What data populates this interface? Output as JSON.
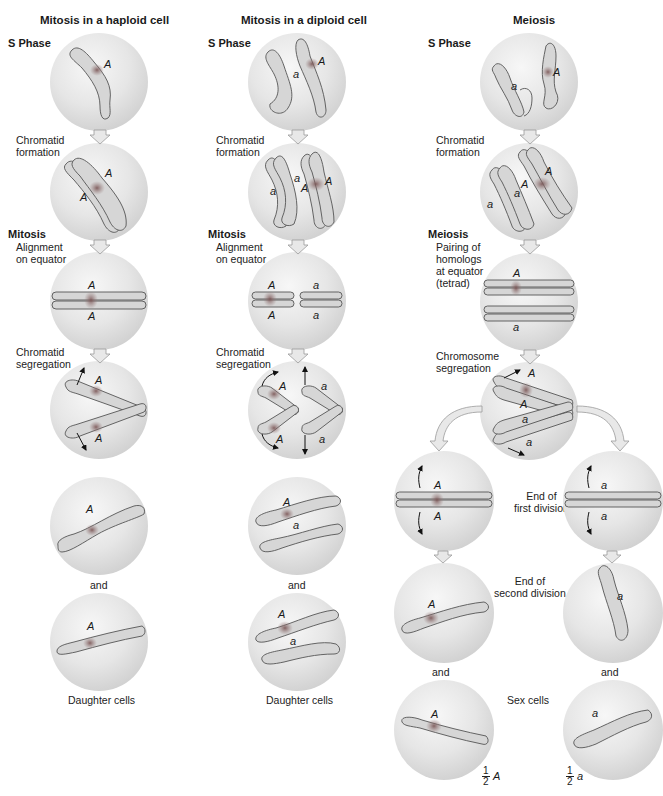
{
  "columns": [
    {
      "title": "Mitosis in a haploid cell",
      "phases": {
        "s_phase": "S Phase",
        "division": "Mitosis"
      },
      "steps": [
        "Chromatid\nformation",
        "Alignment\non equator",
        "Chromatid\nsegregation"
      ],
      "captions": {
        "and": "and",
        "result": "Daughter cells"
      },
      "gene_labels": {
        "s_phase": [
          "A"
        ],
        "chromatid": [
          "A",
          "A"
        ],
        "alignment": [
          "A",
          "A"
        ],
        "segregation": [
          "A",
          "A"
        ],
        "daughter_1": [
          "A"
        ],
        "daughter_2": [
          "A"
        ]
      }
    },
    {
      "title": "Mitosis in a diploid cell",
      "phases": {
        "s_phase": "S Phase",
        "division": "Mitosis"
      },
      "steps": [
        "Chromatid\nformation",
        "Alignment\non equator",
        "Chromatid\nsegregation"
      ],
      "captions": {
        "and": "and",
        "result": "Daughter cells"
      },
      "gene_labels": {
        "s_phase": [
          "a",
          "A"
        ],
        "chromatid": [
          "a",
          "a",
          "A",
          "A"
        ],
        "alignment": [
          "A",
          "a",
          "A",
          "a"
        ],
        "segregation": [
          "A",
          "a",
          "A",
          "a"
        ],
        "daughter_1": [
          "A",
          "a"
        ],
        "daughter_2": [
          "A",
          "a"
        ]
      }
    },
    {
      "title": "Meiosis",
      "phases": {
        "s_phase": "S Phase",
        "division": "Meiosis"
      },
      "steps": [
        "Chromatid\nformation",
        "Pairing of\nhomologs\nat equator\n(tetrad)",
        "Chromosome\nsegregation"
      ],
      "stage_labels": [
        "End of\nfirst division",
        "End of\nsecond division",
        "Sex cells"
      ],
      "captions": {
        "and_left": "and",
        "and_right": "and"
      },
      "gene_labels": {
        "s_phase": [
          "a",
          "A"
        ],
        "chromatid": [
          "a",
          "a",
          "A",
          "A"
        ],
        "tetrad": [
          "A",
          "a"
        ],
        "segregation": [
          "A",
          "A",
          "a",
          "a"
        ],
        "first_division_left": [
          "A",
          "A"
        ],
        "first_division_right": [
          "a",
          "a"
        ],
        "second_division_left": [
          "A"
        ],
        "second_division_right": [
          "a"
        ],
        "sex_cell_left": [
          "A"
        ],
        "sex_cell_right": [
          "a"
        ]
      },
      "fractions": [
        {
          "numerator": "1",
          "denominator": "2",
          "allele": "A"
        },
        {
          "numerator": "1",
          "denominator": "2",
          "allele": "a"
        }
      ]
    }
  ],
  "colors": {
    "cell_fill": "#e3e3e3",
    "cell_edge": "#c4c4c4",
    "chromosome_fill": "#d8d8d8",
    "chromosome_stroke": "#5a5a5a",
    "centromere": "#8a6a6a",
    "arrow_fill": "#e8e8e8",
    "arrow_stroke": "#9a9a9a"
  }
}
